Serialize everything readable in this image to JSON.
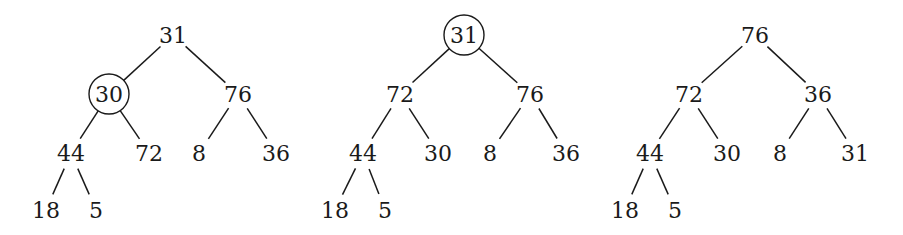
{
  "diagram": {
    "type": "binary-heap-sequence",
    "trees": [
      {
        "id": "tree-1",
        "highlighted": "30",
        "nodes": [
          {
            "id": "a",
            "label": "31",
            "x": 173,
            "y": 35
          },
          {
            "id": "b",
            "label": "30",
            "x": 109,
            "y": 94,
            "circled": true
          },
          {
            "id": "c",
            "label": "76",
            "x": 238,
            "y": 94
          },
          {
            "id": "d",
            "label": "44",
            "x": 71,
            "y": 153
          },
          {
            "id": "e",
            "label": "72",
            "x": 149,
            "y": 153
          },
          {
            "id": "f",
            "label": "8",
            "x": 199,
            "y": 153
          },
          {
            "id": "g",
            "label": "36",
            "x": 276,
            "y": 153
          },
          {
            "id": "h",
            "label": "18",
            "x": 46,
            "y": 210
          },
          {
            "id": "i",
            "label": "5",
            "x": 96,
            "y": 210
          }
        ],
        "edges": [
          [
            "a",
            "b"
          ],
          [
            "a",
            "c"
          ],
          [
            "b",
            "d"
          ],
          [
            "b",
            "e"
          ],
          [
            "c",
            "f"
          ],
          [
            "c",
            "g"
          ],
          [
            "d",
            "h"
          ],
          [
            "d",
            "i"
          ]
        ]
      },
      {
        "id": "tree-2",
        "highlighted": "31",
        "nodes": [
          {
            "id": "a",
            "label": "31",
            "x": 464,
            "y": 35,
            "circled": true
          },
          {
            "id": "b",
            "label": "72",
            "x": 400,
            "y": 94
          },
          {
            "id": "c",
            "label": "76",
            "x": 530,
            "y": 94
          },
          {
            "id": "d",
            "label": "44",
            "x": 363,
            "y": 153
          },
          {
            "id": "e",
            "label": "30",
            "x": 438,
            "y": 153
          },
          {
            "id": "f",
            "label": "8",
            "x": 490,
            "y": 153
          },
          {
            "id": "g",
            "label": "36",
            "x": 566,
            "y": 153
          },
          {
            "id": "h",
            "label": "18",
            "x": 335,
            "y": 210
          },
          {
            "id": "i",
            "label": "5",
            "x": 385,
            "y": 210
          }
        ],
        "edges": [
          [
            "a",
            "b"
          ],
          [
            "a",
            "c"
          ],
          [
            "b",
            "d"
          ],
          [
            "b",
            "e"
          ],
          [
            "c",
            "f"
          ],
          [
            "c",
            "g"
          ],
          [
            "d",
            "h"
          ],
          [
            "d",
            "i"
          ]
        ]
      },
      {
        "id": "tree-3",
        "highlighted": null,
        "nodes": [
          {
            "id": "a",
            "label": "76",
            "x": 755,
            "y": 35
          },
          {
            "id": "b",
            "label": "72",
            "x": 689,
            "y": 94
          },
          {
            "id": "c",
            "label": "36",
            "x": 818,
            "y": 94
          },
          {
            "id": "d",
            "label": "44",
            "x": 650,
            "y": 153
          },
          {
            "id": "e",
            "label": "30",
            "x": 727,
            "y": 153
          },
          {
            "id": "f",
            "label": "8",
            "x": 780,
            "y": 153
          },
          {
            "id": "g",
            "label": "31",
            "x": 855,
            "y": 153
          },
          {
            "id": "h",
            "label": "18",
            "x": 625,
            "y": 210
          },
          {
            "id": "i",
            "label": "5",
            "x": 675,
            "y": 210
          }
        ],
        "edges": [
          [
            "a",
            "b"
          ],
          [
            "a",
            "c"
          ],
          [
            "b",
            "d"
          ],
          [
            "b",
            "e"
          ],
          [
            "c",
            "f"
          ],
          [
            "c",
            "g"
          ],
          [
            "d",
            "h"
          ],
          [
            "d",
            "i"
          ]
        ]
      }
    ]
  }
}
